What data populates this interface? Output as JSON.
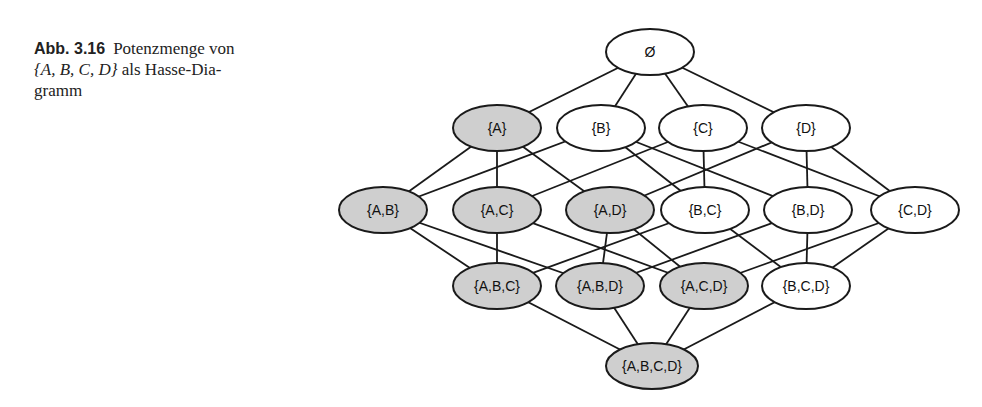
{
  "caption": {
    "figure_number": "Abb. 3.16",
    "text_before": "Potenzmenge von",
    "math": "{A, B, C, D}",
    "text_after": "als Hasse-Diagramm",
    "line1": "Potenzmenge von",
    "line2_math": "{A, B, C, D}",
    "line2_rest": " als Hasse-Dia-",
    "line3": "gramm"
  },
  "colors": {
    "highlight_fill": "#cfcfcf",
    "plain_fill": "#ffffff",
    "stroke": "#1a1a1a"
  },
  "nodes": [
    {
      "id": "empty",
      "label": "Ø",
      "x": 650,
      "y": 52,
      "highlight": false
    },
    {
      "id": "A",
      "label": "{A}",
      "x": 497,
      "y": 128,
      "highlight": true
    },
    {
      "id": "B",
      "label": "{B}",
      "x": 601,
      "y": 128,
      "highlight": false
    },
    {
      "id": "C",
      "label": "{C}",
      "x": 703,
      "y": 128,
      "highlight": false
    },
    {
      "id": "D",
      "label": "{D}",
      "x": 806,
      "y": 128,
      "highlight": false
    },
    {
      "id": "AB",
      "label": "{A,B}",
      "x": 383,
      "y": 210,
      "highlight": true
    },
    {
      "id": "AC",
      "label": "{A,C}",
      "x": 497,
      "y": 210,
      "highlight": true
    },
    {
      "id": "AD",
      "label": "{A,D}",
      "x": 610,
      "y": 210,
      "highlight": true
    },
    {
      "id": "BC",
      "label": "{B,C}",
      "x": 705,
      "y": 210,
      "highlight": false
    },
    {
      "id": "BD",
      "label": "{B,D}",
      "x": 808,
      "y": 210,
      "highlight": false
    },
    {
      "id": "CD",
      "label": "{C,D}",
      "x": 915,
      "y": 210,
      "highlight": false
    },
    {
      "id": "ABC",
      "label": "{A,B,C}",
      "x": 497,
      "y": 286,
      "highlight": true
    },
    {
      "id": "ABD",
      "label": "{A,B,D}",
      "x": 600,
      "y": 286,
      "highlight": true
    },
    {
      "id": "ACD",
      "label": "{A,C,D}",
      "x": 704,
      "y": 286,
      "highlight": true
    },
    {
      "id": "BCD",
      "label": "{B,C,D}",
      "x": 806,
      "y": 286,
      "highlight": false
    },
    {
      "id": "ABCD",
      "label": "{A,B,C,D}",
      "x": 652,
      "y": 366,
      "highlight": true
    }
  ],
  "edges": [
    [
      "empty",
      "A"
    ],
    [
      "empty",
      "B"
    ],
    [
      "empty",
      "C"
    ],
    [
      "empty",
      "D"
    ],
    [
      "A",
      "AB"
    ],
    [
      "A",
      "AC"
    ],
    [
      "A",
      "AD"
    ],
    [
      "B",
      "AB"
    ],
    [
      "B",
      "BC"
    ],
    [
      "B",
      "BD"
    ],
    [
      "C",
      "AC"
    ],
    [
      "C",
      "BC"
    ],
    [
      "C",
      "CD"
    ],
    [
      "D",
      "AD"
    ],
    [
      "D",
      "BD"
    ],
    [
      "D",
      "CD"
    ],
    [
      "AB",
      "ABC"
    ],
    [
      "AB",
      "ABD"
    ],
    [
      "AC",
      "ABC"
    ],
    [
      "AC",
      "ACD"
    ],
    [
      "AD",
      "ABD"
    ],
    [
      "AD",
      "ACD"
    ],
    [
      "BC",
      "ABC"
    ],
    [
      "BC",
      "BCD"
    ],
    [
      "BD",
      "ABD"
    ],
    [
      "BD",
      "BCD"
    ],
    [
      "CD",
      "ACD"
    ],
    [
      "CD",
      "BCD"
    ],
    [
      "ABC",
      "ABCD"
    ],
    [
      "ABD",
      "ABCD"
    ],
    [
      "ACD",
      "ABCD"
    ],
    [
      "BCD",
      "ABCD"
    ]
  ]
}
